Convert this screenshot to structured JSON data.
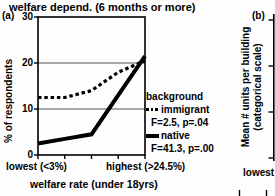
{
  "title": "welfare depend. (6 months or more)",
  "panel_a": {
    "label": "(a)",
    "ylabel": "% of respondents",
    "xlabel": "welfare rate (under 18yrs)",
    "x_left_label": "lowest (<3%)",
    "x_right_label": "highest (>24.5%)"
  },
  "legend": {
    "header": "background",
    "items": [
      {
        "name": "immigrant",
        "stats": "F=2.5, p=.04",
        "line_style": "dashed"
      },
      {
        "name": "native",
        "stats": "F=41.3, p=.00",
        "line_style": "solid"
      }
    ]
  },
  "panel_b": {
    "label": "(b)",
    "ylabel_line1": "Mean # units per building",
    "ylabel_line2": "(categorical scale)",
    "x_partial_label": "lowest"
  },
  "chart_data": {
    "type": "line",
    "title": "welfare depend. (6 months or more)",
    "xlabel": "welfare rate (under 18yrs)",
    "ylabel": "% of respondents",
    "categories": [
      "lowest (<3%)",
      "",
      "",
      "",
      "highest (>24.5%)"
    ],
    "series": [
      {
        "name": "background immigrant",
        "line_style": "dashed",
        "values": [
          12.5,
          12.5,
          14,
          18,
          20.5
        ],
        "stats": "F=2.5, p=.04"
      },
      {
        "name": "native",
        "line_style": "solid",
        "values": [
          2.5,
          3.5,
          4.5,
          13,
          21.5
        ],
        "stats": "F=41.3, p=.00"
      }
    ],
    "ylim": [
      0,
      30
    ],
    "yticks": [
      0,
      10,
      20,
      30
    ],
    "gridlines": [
      10,
      20
    ],
    "grid_on": true,
    "legend_position": "right"
  }
}
